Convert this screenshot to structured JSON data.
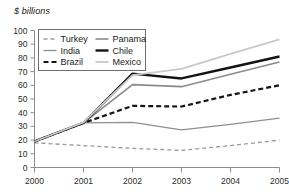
{
  "chart_data": {
    "type": "line",
    "title": "",
    "subtitle": "",
    "ylabel": "$ billions",
    "xlabel": "",
    "x": [
      2000,
      2001,
      2002,
      2003,
      2004,
      2005
    ],
    "categories": [
      "2000",
      "2001",
      "2002",
      "2003",
      "2004",
      "2005"
    ],
    "ylim": [
      0,
      100
    ],
    "xlim": [
      2000,
      2005
    ],
    "ytick_labels": [
      "0",
      "10",
      "20",
      "30",
      "40",
      "50",
      "60",
      "70",
      "80",
      "90",
      "100"
    ],
    "ytick_values": [
      0,
      10,
      20,
      30,
      40,
      50,
      60,
      70,
      80,
      90,
      100
    ],
    "xtick_labels": [
      "2000",
      "2001",
      "2002",
      "2003",
      "2004",
      "2005"
    ],
    "grid": false,
    "legend_position": "top-left-inside",
    "series": [
      {
        "name": "Turkey",
        "values": [
          18,
          16,
          14,
          12.5,
          16,
          20
        ],
        "color": "#9a9a9a",
        "style": "dashed",
        "width": 1.3
      },
      {
        "name": "India",
        "values": [
          19,
          32.5,
          33,
          27.5,
          31.5,
          36
        ],
        "color": "#8f8f8f",
        "style": "solid",
        "width": 1.3
      },
      {
        "name": "Brazil",
        "values": [
          19,
          32.5,
          45,
          44.5,
          53,
          60
        ],
        "color": "#151515",
        "style": "dashed",
        "width": 2.2
      },
      {
        "name": "Panama",
        "values": [
          19,
          32.5,
          60.5,
          59,
          68,
          77
        ],
        "color": "#8a8a8a",
        "style": "solid",
        "width": 1.6
      },
      {
        "name": "Chile",
        "values": [
          19,
          32.5,
          68.5,
          65,
          73,
          81
        ],
        "color": "#131313",
        "style": "solid",
        "width": 2.4
      },
      {
        "name": "Mexico",
        "values": [
          19,
          33,
          67.5,
          72,
          83,
          93.5
        ],
        "color": "#c9c9c9",
        "style": "solid",
        "width": 1.8
      }
    ],
    "legend": [
      {
        "label": "Turkey",
        "color": "#9a9a9a",
        "style": "dashed",
        "width": 1.3
      },
      {
        "label": "Panama",
        "color": "#8a8a8a",
        "style": "solid",
        "width": 1.6
      },
      {
        "label": "India",
        "color": "#8f8f8f",
        "style": "solid",
        "width": 1.3
      },
      {
        "label": "Chile",
        "color": "#131313",
        "style": "solid",
        "width": 2.4
      },
      {
        "label": "Brazil",
        "color": "#151515",
        "style": "dashed",
        "width": 2.2
      },
      {
        "label": "Mexico",
        "color": "#c9c9c9",
        "style": "solid",
        "width": 1.8
      }
    ],
    "axis_color": "#8c8c8c",
    "text_color": "#2b2b2b",
    "background": "#ffffff"
  }
}
